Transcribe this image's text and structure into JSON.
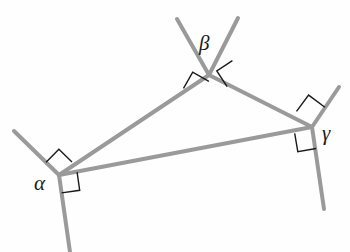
{
  "figure": {
    "type": "geometric-diagram",
    "background_color": "#fefefe",
    "line_color": "#9a9a9a",
    "line_width": 4,
    "mark_color": "#1a1a1a",
    "mark_width": 1.4,
    "label_color": "#1a1a1a"
  },
  "vertices": [
    {
      "id": "alpha",
      "label": "α",
      "x": 59,
      "y": 175,
      "label_x": 34,
      "label_y": 190
    },
    {
      "id": "beta",
      "label": "β",
      "x": 209,
      "y": 75,
      "label_x": 199,
      "label_y": 50
    },
    {
      "id": "gamma",
      "label": "γ",
      "x": 312,
      "y": 127,
      "label_x": 322,
      "label_y": 140
    }
  ],
  "triangle_sides": [
    {
      "id": "side-alpha-beta",
      "from": "alpha",
      "to": "beta",
      "x1": 59,
      "y1": 175,
      "x2": 209,
      "y2": 75
    },
    {
      "id": "side-beta-gamma",
      "from": "beta",
      "to": "gamma",
      "x1": 209,
      "y1": 75,
      "x2": 312,
      "y2": 127
    },
    {
      "id": "side-gamma-alpha",
      "from": "gamma",
      "to": "alpha",
      "x1": 312,
      "y1": 127,
      "x2": 59,
      "y2": 175
    }
  ],
  "rays": [
    {
      "id": "ray-alpha-upper-left",
      "vertex": "alpha",
      "x1": 59,
      "y1": 175,
      "x2": 14,
      "y2": 131
    },
    {
      "id": "ray-alpha-lower",
      "vertex": "alpha",
      "x1": 59,
      "y1": 175,
      "x2": 70,
      "y2": 252
    },
    {
      "id": "ray-beta-upper-left",
      "vertex": "beta",
      "x1": 209,
      "y1": 75,
      "x2": 177,
      "y2": 19
    },
    {
      "id": "ray-beta-upper-right",
      "vertex": "beta",
      "x1": 209,
      "y1": 75,
      "x2": 238,
      "y2": 18
    },
    {
      "id": "ray-gamma-upper",
      "vertex": "gamma",
      "x1": 312,
      "y1": 127,
      "x2": 339,
      "y2": 87
    },
    {
      "id": "ray-gamma-lower",
      "vertex": "gamma",
      "x1": 312,
      "y1": 127,
      "x2": 324,
      "y2": 209
    }
  ],
  "right_angle_marks": [
    {
      "id": "mark-alpha-upper",
      "vertex": "alpha",
      "points": "46.1,162.3 58.9,149.2 72.0,161.9"
    },
    {
      "id": "mark-alpha-lower",
      "vertex": "alpha",
      "points": "61.6,192.9 79.7,190.3 77.1,172.2"
    },
    {
      "id": "mark-beta-left",
      "vertex": "beta",
      "points": "183.5,88.4 192.7,72.2 208.9,81.4"
    },
    {
      "id": "mark-beta-right",
      "vertex": "beta",
      "points": "227.1,86.6 216.8,71.0 232.4,60.6"
    },
    {
      "id": "mark-gamma-upper",
      "vertex": "gamma",
      "points": "296.5,111.4 308.6,95.1 324.9,107.2"
    },
    {
      "id": "mark-gamma-lower",
      "vertex": "gamma",
      "points": "294.7,133.3 297.8,151.6 316.1,148.5"
    }
  ],
  "labels": {
    "alpha": "α",
    "beta": "β",
    "gamma": "γ"
  }
}
